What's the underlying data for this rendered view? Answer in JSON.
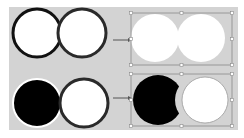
{
  "diagram": {
    "colors": {
      "background": "#ffffff",
      "canvas": "#d3d3d3",
      "fill_white": "#ffffff",
      "fill_black": "#000000",
      "stroke_dark": "#1a1a1a",
      "selection": "#8a8a8a",
      "arrow": "#555555"
    },
    "rows": [
      {
        "operation": "union",
        "before": [
          {
            "shape": "circle",
            "fill": "#ffffff",
            "stroke": "#111111"
          },
          {
            "shape": "circle",
            "fill": "#ffffff",
            "stroke": "#333333"
          }
        ],
        "after": {
          "shape": "merged-circles",
          "fill": "#ffffff",
          "selected": true
        }
      },
      {
        "operation": "subtract",
        "before": [
          {
            "shape": "circle",
            "fill": "#000000",
            "stroke": "#ffffff"
          },
          {
            "shape": "circle",
            "fill": "#ffffff",
            "stroke": "#333333"
          }
        ],
        "after": {
          "shape": "crescent-and-circle",
          "fill": [
            "#000000",
            "#ffffff"
          ],
          "selected": true
        }
      }
    ]
  }
}
